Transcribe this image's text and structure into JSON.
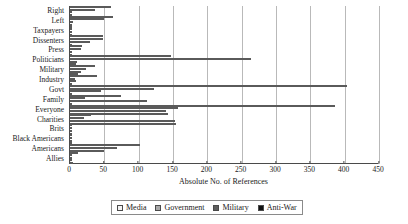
{
  "chart_data": {
    "type": "bar",
    "orientation": "horizontal",
    "title": "",
    "xlabel": "Absolute No. of References",
    "ylabel": "",
    "xlim": [
      0,
      450
    ],
    "xticks": [
      0,
      50,
      100,
      150,
      200,
      250,
      300,
      350,
      400,
      450
    ],
    "grid": true,
    "legend_position": "bottom",
    "categories": [
      "Right",
      "Left",
      "Taxpayers",
      "Dissenters",
      "Press",
      "Politicians",
      "Military",
      "Industry",
      "Govt",
      "Family",
      "Everyone",
      "Charities",
      "Brits",
      "Black Americans",
      "Americans",
      "Allies"
    ],
    "series": [
      {
        "name": "Media",
        "color": "#f2f2f2",
        "values": [
          60,
          62,
          3,
          48,
          17,
          147,
          37,
          40,
          403,
          74,
          386,
          30,
          2,
          2,
          102,
          3
        ]
      },
      {
        "name": "Government",
        "color": "#a8a8a8",
        "values": [
          36,
          49,
          2,
          48,
          16,
          263,
          23,
          8,
          122,
          22,
          158,
          21,
          2,
          1,
          68,
          2
        ]
      },
      {
        "name": "Military",
        "color": "#5e5e5e",
        "values": [
          1,
          5,
          1,
          29,
          2,
          10,
          16,
          9,
          45,
          112,
          140,
          153,
          2,
          1,
          49,
          3
        ]
      },
      {
        "name": "Anti-War",
        "color": "#111111",
        "values": [
          1,
          2,
          2,
          1,
          1,
          9,
          11,
          1,
          2,
          1,
          143,
          154,
          3,
          2,
          12,
          4
        ]
      }
    ]
  },
  "legend": {
    "items": [
      {
        "label": "Media",
        "key": "media"
      },
      {
        "label": "Government",
        "key": "government"
      },
      {
        "label": "Military",
        "key": "military"
      },
      {
        "label": "Anti-War",
        "key": "antiwar"
      }
    ]
  }
}
